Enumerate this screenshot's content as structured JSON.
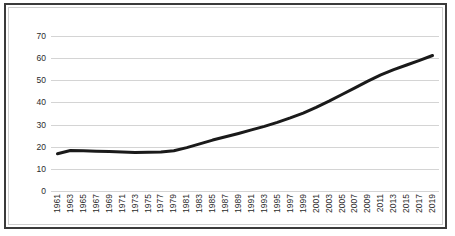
{
  "chart_data": {
    "type": "line",
    "title": "",
    "subtitle": "",
    "xlabel": "",
    "ylabel": "",
    "grid": "horizontal",
    "legend": "none",
    "xlim": [
      1961,
      2019
    ],
    "ylim": [
      0,
      70
    ],
    "ytick_labels": [
      "70",
      "60",
      "50",
      "40",
      "30",
      "20",
      "10",
      "0"
    ],
    "ytick_values": [
      70,
      60,
      50,
      40,
      30,
      20,
      10,
      0
    ],
    "categories": [
      "1961",
      "1963",
      "1965",
      "1967",
      "1969",
      "1971",
      "1973",
      "1975",
      "1977",
      "1979",
      "1981",
      "1983",
      "1985",
      "1987",
      "1989",
      "1991",
      "1993",
      "1995",
      "1997",
      "1999",
      "2001",
      "2003",
      "2005",
      "2007",
      "2009",
      "2011",
      "2013",
      "2015",
      "2017",
      "2019"
    ],
    "x": [
      1961,
      1963,
      1965,
      1967,
      1969,
      1971,
      1973,
      1975,
      1977,
      1979,
      1981,
      1983,
      1985,
      1987,
      1989,
      1991,
      1993,
      1995,
      1997,
      1999,
      2001,
      2003,
      2005,
      2007,
      2009,
      2011,
      2013,
      2015,
      2017,
      2019
    ],
    "values": [
      16.8,
      18.3,
      18.2,
      18.0,
      17.8,
      17.6,
      17.4,
      17.5,
      17.6,
      18.2,
      19.6,
      21.3,
      23.0,
      24.5,
      26.0,
      27.6,
      29.2,
      31.0,
      33.0,
      35.2,
      37.8,
      40.6,
      43.6,
      46.6,
      49.6,
      52.4,
      54.8,
      56.9,
      59.0,
      61.2
    ],
    "series": [
      {
        "name": "series-1",
        "color": "#1a1a1a",
        "line_width": 3,
        "values": [
          16.8,
          18.3,
          18.2,
          18.0,
          17.8,
          17.6,
          17.4,
          17.5,
          17.6,
          18.2,
          19.6,
          21.3,
          23.0,
          24.5,
          26.0,
          27.6,
          29.2,
          31.0,
          33.0,
          35.2,
          37.8,
          40.6,
          43.6,
          46.6,
          49.6,
          52.4,
          54.8,
          56.9,
          59.0,
          61.2
        ]
      }
    ],
    "colors": {
      "line": "#1a1a1a",
      "gridline": "#d4d4d4",
      "frame": "#3a3a3a",
      "text": "#2b2b2b",
      "background": "#ffffff"
    }
  }
}
